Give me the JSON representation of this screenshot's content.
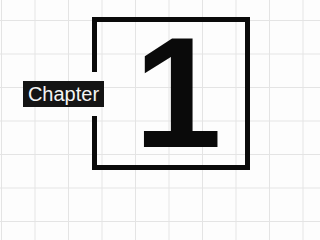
{
  "badge": {
    "label": "Chapter"
  },
  "number": {
    "value": "1"
  },
  "colors": {
    "ink": "#0a0a0a",
    "background": "#fdfdfd",
    "grid": "#e4e4e4",
    "label_text": "#f4f4f4"
  }
}
